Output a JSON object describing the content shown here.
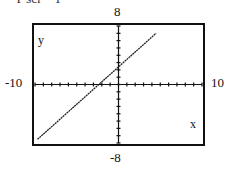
{
  "header": {
    "partial_text": "Y scl = 1"
  },
  "labels": {
    "ymax": "8",
    "ymin": "-8",
    "xmin": "-10",
    "xmax": "10",
    "x_axis": "x",
    "y_axis": "y"
  },
  "chart_data": {
    "type": "line",
    "title": "",
    "xlabel": "x",
    "ylabel": "y",
    "xlim": [
      -10,
      10
    ],
    "ylim": [
      -8,
      8
    ],
    "xscl": 1,
    "yscl": 1,
    "grid": false,
    "series": [
      {
        "name": "line",
        "x": [
          -9.7,
          4.5
        ],
        "y": [
          -7.5,
          7.0
        ]
      }
    ],
    "tick_labels": {
      "x": [
        "-10",
        "10"
      ],
      "y": [
        "-8",
        "8"
      ]
    }
  }
}
